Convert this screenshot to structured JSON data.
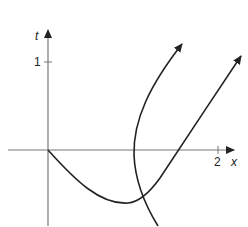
{
  "axes": {
    "x_label": "x",
    "y_label": "t",
    "x_tick_label": "2",
    "y_tick_label": "1",
    "color": "#555555"
  },
  "curves": [
    {
      "name": "curve-through-origin",
      "description": "starts at origin, dips below x-axis, rises to upper right with arrow"
    },
    {
      "name": "c-shaped-curve",
      "description": "comes from below, bends left crossing x-axis near x=1, rises to upper right with arrow"
    }
  ],
  "colors": {
    "curve": "#222222",
    "axis": "#666666"
  }
}
